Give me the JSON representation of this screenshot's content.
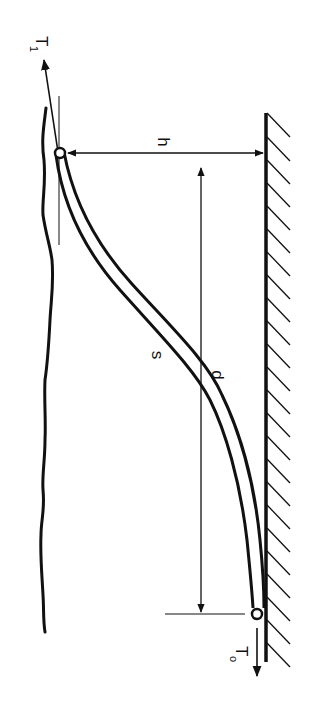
{
  "figure": {
    "orientation": "rotated-90-clockwise",
    "labels": {
      "top_tension": "T",
      "top_tension_sub": "1",
      "height": "h",
      "line_length": "s",
      "horizontal_distance": "d",
      "bottom_tension": "T",
      "bottom_tension_sub": "o"
    },
    "colors": {
      "ink": "#111111",
      "background": "#ffffff"
    }
  }
}
